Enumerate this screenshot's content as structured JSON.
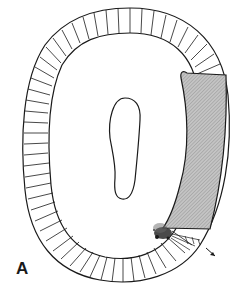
{
  "figure": {
    "panel_label": "A",
    "colors": {
      "outline": "#1a1a1a",
      "shaded_region": "#b8b8b8",
      "background": "#ffffff"
    },
    "elements": [
      {
        "name": "outer-ring",
        "segments": 52
      },
      {
        "name": "central-cavity"
      },
      {
        "name": "shaded-wedge"
      },
      {
        "name": "disruption-zone"
      },
      {
        "name": "direction-arrow"
      }
    ]
  }
}
